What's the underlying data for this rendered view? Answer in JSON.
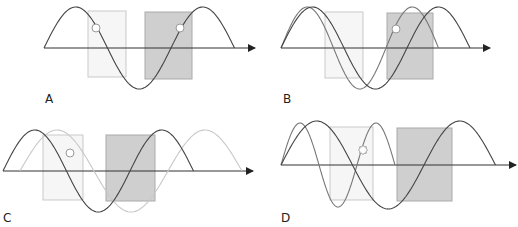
{
  "colors": {
    "axis": "#333333",
    "dark_wave": "#444444",
    "mid_wave": "#777777",
    "light_wave": "#c8c8c8",
    "light_rect_fill": "#f6f6f6",
    "light_rect_stroke": "#c9c9c9",
    "dark_rect_fill": "#cfcfcf",
    "dark_rect_stroke": "#aaaaaa",
    "marker_fill": "#ffffff",
    "marker_stroke": "#999999"
  },
  "panels": [
    {
      "id": "A",
      "label": "A",
      "label_pos": [
        45,
        103
      ],
      "axis": {
        "x1": 44,
        "x2": 255,
        "y": 48
      },
      "light_rect": {
        "x": 88,
        "y": 11,
        "w": 38,
        "h": 66
      },
      "dark_rect": {
        "x": 145,
        "y": 12,
        "w": 47,
        "h": 67
      },
      "waves": [
        {
          "role": "primary",
          "tone": "dark_wave",
          "x0": 44,
          "period": 127,
          "amp": 41,
          "cycles": 1.5
        }
      ],
      "markers": [
        {
          "x": 96,
          "y": 28,
          "type": "circle"
        },
        {
          "x": 180,
          "y": 28,
          "type": "circle"
        }
      ]
    },
    {
      "id": "B",
      "label": "B",
      "label_pos": [
        283,
        103
      ],
      "axis": {
        "x1": 281,
        "x2": 490,
        "y": 48
      },
      "light_rect": {
        "x": 325,
        "y": 12,
        "w": 38,
        "h": 66
      },
      "dark_rect": {
        "x": 387,
        "y": 13,
        "w": 46,
        "h": 66
      },
      "waves": [
        {
          "role": "reference",
          "tone": "mid_wave",
          "x0": 281,
          "period": 105,
          "amp": 41,
          "cycles": 1.5
        },
        {
          "role": "primary",
          "tone": "dark_wave",
          "x0": 281,
          "period": 126,
          "amp": 41,
          "cycles": 1.5
        }
      ],
      "markers": [
        {
          "x": 396,
          "y": 29,
          "type": "circle"
        }
      ]
    },
    {
      "id": "C",
      "label": "C",
      "label_pos": [
        3,
        222
      ],
      "axis": {
        "x1": 3,
        "x2": 253,
        "y": 171
      },
      "light_rect": {
        "x": 43,
        "y": 135,
        "w": 40,
        "h": 65
      },
      "dark_rect": {
        "x": 106,
        "y": 135,
        "w": 49,
        "h": 66
      },
      "waves": [
        {
          "role": "shifted",
          "tone": "light_wave",
          "x0": 20,
          "period": 148,
          "amp": 41,
          "cycles": 1.5
        },
        {
          "role": "primary",
          "tone": "dark_wave",
          "x0": 3,
          "period": 127,
          "amp": 41,
          "cycles": 1.5
        }
      ],
      "markers": [
        {
          "x": 70,
          "y": 153,
          "type": "circle"
        }
      ]
    },
    {
      "id": "D",
      "label": "D",
      "label_pos": [
        281,
        222
      ],
      "axis": {
        "x1": 281,
        "x2": 516,
        "y": 165
      },
      "light_rect": {
        "x": 330,
        "y": 127,
        "w": 43,
        "h": 73
      },
      "dark_rect": {
        "x": 397,
        "y": 128,
        "w": 55,
        "h": 73
      },
      "waves": [
        {
          "role": "fast",
          "tone": "mid_wave",
          "x0": 281,
          "period": 76,
          "amp": 42,
          "cycles": 1.5
        },
        {
          "role": "primary",
          "tone": "dark_wave",
          "x0": 281,
          "period": 143,
          "amp": 44,
          "cycles": 1.5
        }
      ],
      "markers": [
        {
          "x": 363,
          "y": 150,
          "type": "gear"
        }
      ]
    }
  ]
}
